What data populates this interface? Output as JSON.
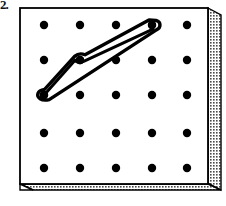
{
  "figure": {
    "kind": "geoboard-illustration",
    "label_text": "2.",
    "caption": "",
    "board": {
      "name": "geoboard",
      "face_fill": "#ffffff",
      "outline_color": "#000000",
      "outline_width": 1.6,
      "face": {
        "x": 20,
        "y": 8,
        "width": 188,
        "height": 176
      },
      "side_panel": {
        "name": "right-side-panel",
        "texture": "stipple",
        "fill": "#c9c9c9",
        "width": 13,
        "top_offset": 7,
        "points": "208,8 221,15 221,190 208,183"
      },
      "bottom_panel": {
        "name": "bottom-side-panel",
        "texture": "stipple",
        "fill": "#c9c9c9",
        "height": 13,
        "points": "20,184 208,184 221,191 33,191"
      },
      "bevel_corner": {
        "name": "bottom-left-bevel",
        "points": "20,184 33,191 20,191"
      }
    },
    "grid": {
      "name": "peg-grid",
      "rows": 5,
      "cols": 5,
      "peg_radius": 4.2,
      "peg_color": "#000000",
      "col_x": [
        44,
        80,
        116,
        152,
        187
      ],
      "row_y": [
        25,
        60,
        95,
        133,
        168
      ]
    },
    "rubber_band": {
      "name": "rubber-band",
      "stroke_color": "#000000",
      "stroke_width": 3.4,
      "fill": "none",
      "anchor_pegs": [
        {
          "row": 0,
          "col": 3,
          "x": 152,
          "y": 25
        },
        {
          "row": 1,
          "col": 1,
          "x": 80,
          "y": 60
        },
        {
          "row": 2,
          "col": 0,
          "x": 44,
          "y": 95
        }
      ],
      "outer_path": "M 152.0 20.6 C 157.6 21.0 160.2 24.6 157.6 28.6 L 49.5 99.6 C 46.4 101.6 41.2 101.0 39.4 97.8 C 37.6 94.6 40.4 90.6 44.0 90.4 L 75.5 55.6 C 77.0 54.0 80.6 53.2 83.2 54.6 L 147.0 21.4 C 148.6 20.6 150.3 20.5 152.0 20.6 Z",
      "inner_path": "M 150.6 26.8 L 85.0 62.4 C 82.2 63.6 78.6 63.4 76.6 61.6 L 47.6 93.2 L 150.6 26.8 Z",
      "description": "thin elongated loop stretched between three pegs"
    }
  }
}
